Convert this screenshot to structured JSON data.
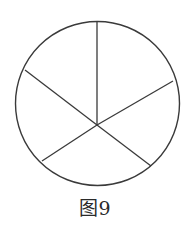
{
  "figure": {
    "caption": "图9",
    "stroke_color": "#3a3a3a",
    "circle": {
      "cx": 97.5,
      "cy": 103.5,
      "r": 82
    },
    "hub": {
      "x": 97,
      "y": 125
    },
    "spokes": [
      {
        "name": "top",
        "x": 97,
        "y": 21
      },
      {
        "name": "upper-right",
        "x": 173,
        "y": 81
      },
      {
        "name": "lower-right",
        "x": 151,
        "y": 166
      },
      {
        "name": "lower-left",
        "x": 42,
        "y": 161
      },
      {
        "name": "upper-left",
        "x": 25,
        "y": 70
      }
    ]
  }
}
